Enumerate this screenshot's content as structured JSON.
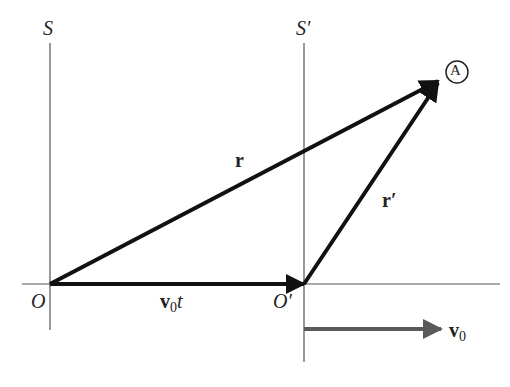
{
  "diagram": {
    "frames": {
      "S": {
        "label": "S",
        "origin_label": "O"
      },
      "S_prime": {
        "label": "S′",
        "origin_label": "O′"
      }
    },
    "vectors": {
      "r": {
        "label": "r"
      },
      "r_prime": {
        "label": "r′"
      },
      "v0t": {
        "label_main": "v",
        "label_sub": "0",
        "label_suffix": "t"
      },
      "v0": {
        "label_main": "v",
        "label_sub": "0"
      }
    },
    "point": {
      "label": "A"
    },
    "colors": {
      "axis": "#555555",
      "vector": "#111111",
      "velocity_arrow": "#5a5a5a",
      "background": "#ffffff"
    }
  }
}
